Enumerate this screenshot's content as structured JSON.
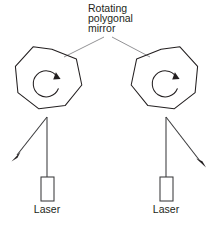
{
  "figure": {
    "background_color": "#ffffff",
    "ink_color": "#231f20",
    "leader_color": "#6e6e72",
    "width": 219,
    "height": 228
  },
  "annotation": {
    "name": "rotating-polygonal-mirror-label",
    "lines": [
      "Rotating",
      "polygonal",
      "mirror"
    ],
    "line1": "Rotating",
    "line2": "polygonal",
    "line3": "mirror",
    "text_x": 88,
    "line_y": [
      12,
      22,
      32
    ]
  },
  "assemblies": [
    {
      "id": "left",
      "mirror_label": "Rotating polygonal mirror",
      "mirror": {
        "center_x": 47,
        "center_y": 84,
        "radius": 35,
        "sides": 9,
        "rotation_deg": -8
      },
      "rotation_arrow": {
        "direction": "clockwise",
        "center_x": 47,
        "center_y": 83,
        "radius": 13
      },
      "beam": {
        "from_x": 47,
        "from_y": 117,
        "to_x": 13,
        "to_y": 160
      },
      "stem": {
        "from_x": 47,
        "from_y": 117,
        "to_x": 47,
        "to_y": 177
      },
      "laser": {
        "label": "Laser",
        "box_x": 41,
        "box_y": 177,
        "box_w": 13,
        "box_h": 24,
        "label_x": 47,
        "label_y": 213
      }
    },
    {
      "id": "right",
      "mirror_label": "Rotating polygonal mirror",
      "mirror": {
        "center_x": 166,
        "center_y": 84,
        "radius": 35,
        "sides": 9,
        "rotation_deg": 8
      },
      "rotation_arrow": {
        "direction": "clockwise",
        "center_x": 166,
        "center_y": 83,
        "radius": 13
      },
      "beam": {
        "from_x": 166,
        "from_y": 117,
        "to_x": 205,
        "to_y": 166
      },
      "stem": {
        "from_x": 166,
        "from_y": 117,
        "to_x": 166,
        "to_y": 177
      },
      "laser": {
        "label": "Laser",
        "box_x": 160,
        "box_y": 177,
        "box_w": 13,
        "box_h": 24,
        "label_x": 166,
        "label_y": 213
      }
    }
  ],
  "leader_lines": [
    {
      "name": "leader-to-left-mirror",
      "x1": 104,
      "y1": 37,
      "x2": 64,
      "y2": 57
    },
    {
      "name": "leader-to-right-mirror",
      "x1": 112,
      "y1": 37,
      "x2": 150,
      "y2": 57
    }
  ]
}
